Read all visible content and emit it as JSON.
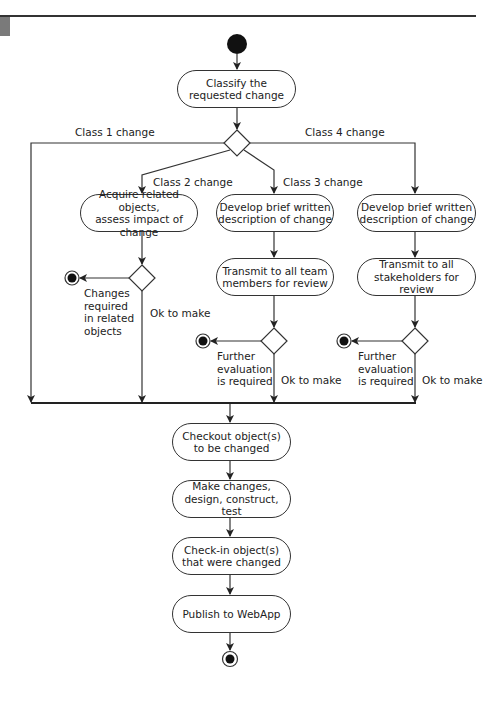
{
  "diagram": {
    "type": "UML activity diagram",
    "nodes": {
      "classify": "Classify the\nrequested change",
      "acquire": "Acquire related objects,\nassess impact of change",
      "develop_team": "Develop brief written\ndescription of change",
      "transmit_team": "Transmit to all team\nmembers for review",
      "develop_stake": "Develop brief written\ndescription of change",
      "transmit_stake": "Transmit to all\nstakeholders for review",
      "checkout": "Checkout object(s)\nto be changed",
      "make": "Make changes,\ndesign, construct, test",
      "checkin": "Check-in object(s)\nthat were changed",
      "publish": "Publish to WebApp"
    },
    "labels": {
      "class1": "Class 1 change",
      "class2": "Class 2 change",
      "class3": "Class 3 change",
      "class4": "Class 4 change",
      "changes_required": "Changes\nrequired\nin related\nobjects",
      "ok_col2": "Ok to make",
      "further_col3": "Further\nevaluation\nis required",
      "ok_col3": "Ok to make",
      "further_col4": "Further\nevaluation\nis required",
      "ok_col4": "Ok to make"
    },
    "colors": {
      "stroke": "#333333",
      "fill": "#ffffff",
      "text": "#222222"
    }
  }
}
